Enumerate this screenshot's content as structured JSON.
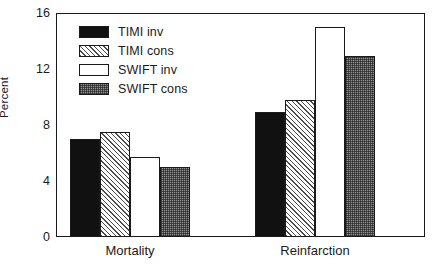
{
  "chart_data": {
    "type": "bar",
    "title": "",
    "xlabel": "",
    "ylabel": "Percent",
    "ylim": [
      0,
      16
    ],
    "yticks": [
      0,
      4,
      8,
      12,
      16
    ],
    "ytick_labels": [
      "0",
      "4",
      "8",
      "12",
      "16"
    ],
    "grid": false,
    "legend_position": "upper-left-inside",
    "categories": [
      "Mortality",
      "Reinfarction"
    ],
    "series": [
      {
        "name": "TIMI inv",
        "pattern": "solid-black",
        "values": [
          7.0,
          8.9
        ]
      },
      {
        "name": "TIMI cons",
        "pattern": "diagonal-hatch",
        "values": [
          7.5,
          9.8
        ]
      },
      {
        "name": "SWIFT inv",
        "pattern": "open-white",
        "values": [
          5.7,
          15.0
        ]
      },
      {
        "name": "SWIFT cons",
        "pattern": "checker-gray",
        "values": [
          5.0,
          12.9
        ]
      }
    ]
  },
  "axis": {
    "y_title": "Percent",
    "y_labels": [
      "16",
      "12",
      "8",
      "4",
      "0"
    ]
  },
  "legend": {
    "items": [
      {
        "label": "TIMI inv"
      },
      {
        "label": "TIMI cons"
      },
      {
        "label": "SWIFT inv"
      },
      {
        "label": "SWIFT cons"
      }
    ]
  },
  "categories": {
    "items": [
      {
        "label": "Mortality"
      },
      {
        "label": "Reinfarction"
      }
    ]
  },
  "colors": {
    "axis": "#1a1a1a",
    "series_solid": "#111111",
    "series_hatch": "#e8e8e8",
    "series_open": "#ffffff",
    "series_check": "#8d8d8d",
    "background": "#ffffff"
  }
}
